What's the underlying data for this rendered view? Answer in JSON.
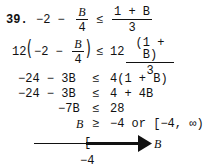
{
  "problem": {
    "number": "39.",
    "line1": {
      "lhs_const": "−2 −",
      "lhs_frac_num": "B",
      "lhs_frac_den": "4",
      "rel": "≤",
      "rhs_frac_num": "1 + B",
      "rhs_frac_den": "3"
    },
    "line2": {
      "coef_left": "12",
      "inner_const": "−2 −",
      "inner_frac_num": "B",
      "inner_frac_den": "4",
      "rel": "≤",
      "coef_right": "12",
      "rhs_frac_num": "(1 + B)",
      "rhs_frac_den": "3"
    },
    "steps": [
      {
        "lhs": "−24 − 3B",
        "rel": "≤",
        "rhs": "4(1 + B)"
      },
      {
        "lhs": "−24 − 3B",
        "rel": "≤",
        "rhs": "4 + 4B"
      },
      {
        "lhs": "−7B",
        "rel": "≤",
        "rhs": "28"
      },
      {
        "lhs": "B",
        "rel": "≥",
        "rhs": "−4 or [−4, ∞)"
      }
    ]
  },
  "number_line": {
    "variable": "B",
    "endpoint_label": "−4",
    "bracket": "[",
    "direction": "right",
    "closed_endpoint": true
  }
}
